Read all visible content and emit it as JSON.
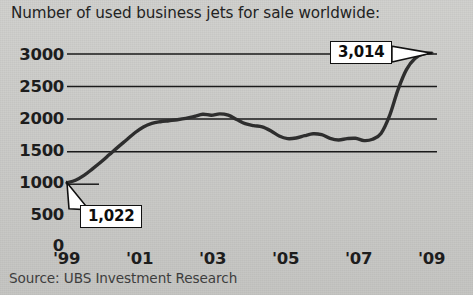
{
  "chart_data": {
    "type": "line",
    "title": "Number of used business jets for sale worldwide:",
    "xlabel": "",
    "ylabel": "",
    "source": "Source: UBS Investment Research",
    "grid": "horizontal",
    "legend": "none",
    "xlim": [
      1999,
      2009.9
    ],
    "ylim": [
      0,
      3200
    ],
    "ytick_labels": [
      "3000",
      "2500",
      "2000",
      "1500",
      "1000",
      "500",
      "0"
    ],
    "ytick_values": [
      3000,
      2500,
      2000,
      1500,
      1000,
      500,
      0
    ],
    "xtick_labels": [
      "'99",
      "'01",
      "'03",
      "'05",
      "'07",
      "'09"
    ],
    "xtick_values": [
      1999,
      2001,
      2003,
      2005,
      2007,
      2009
    ],
    "line_color": "#2e2e2e",
    "grid_color": "#1a1a1a",
    "x": [
      1999.0,
      1999.25,
      1999.5,
      1999.75,
      2000.0,
      2000.25,
      2000.5,
      2000.75,
      2001.0,
      2001.25,
      2001.5,
      2001.75,
      2002.0,
      2002.25,
      2002.5,
      2002.75,
      2003.0,
      2003.25,
      2003.5,
      2003.75,
      2004.0,
      2004.25,
      2004.5,
      2004.75,
      2005.0,
      2005.25,
      2005.5,
      2005.75,
      2006.0,
      2006.25,
      2006.5,
      2006.75,
      2007.0,
      2007.25,
      2007.5,
      2007.75,
      2008.0,
      2008.25,
      2008.5,
      2008.75,
      2009.0,
      2009.25,
      2009.5,
      2009.75
    ],
    "values": [
      1022,
      1060,
      1135,
      1235,
      1340,
      1455,
      1570,
      1680,
      1790,
      1880,
      1935,
      1960,
      1975,
      1990,
      2010,
      2040,
      2075,
      2060,
      2080,
      2060,
      1995,
      1930,
      1900,
      1880,
      1820,
      1740,
      1700,
      1710,
      1745,
      1775,
      1760,
      1705,
      1680,
      1700,
      1705,
      1670,
      1690,
      1780,
      2050,
      2450,
      2760,
      2930,
      3000,
      3014
    ],
    "annotations": [
      {
        "label": "1,022",
        "value": 1022,
        "x": 1999.0,
        "position": "below-right"
      },
      {
        "label": "3,014",
        "value": 3014,
        "x": 2009.75,
        "position": "left"
      }
    ]
  },
  "chart": {
    "title": "Number of used business jets for sale worldwide:",
    "source": "Source: UBS Investment Research",
    "callout_start": "1,022",
    "callout_end": "3,014",
    "y_labels": {
      "y0": "3000",
      "y1": "2500",
      "y2": "2000",
      "y3": "1500",
      "y4": "1000",
      "y5": "500",
      "y6": "0"
    },
    "x_labels": {
      "x0": "'99",
      "x1": "'01",
      "x2": "'03",
      "x3": "'05",
      "x4": "'07",
      "x5": "'09"
    }
  }
}
